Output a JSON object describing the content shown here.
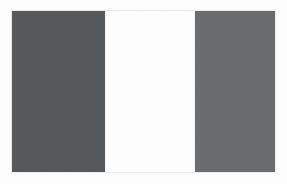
{
  "viewer": {
    "name": "flag-image",
    "background_color": "#fdfdfd",
    "frame_border_color": "#e9e9e9",
    "image_width": 287,
    "image_height": 184
  },
  "flag": {
    "orientation": "vertical-tricolour",
    "band_count": 3,
    "plate": {
      "x": 11,
      "y": 10,
      "width": 265,
      "height": 163
    },
    "bands": [
      {
        "position": "hoist",
        "label": "",
        "color": "#57585a",
        "width_px": 93
      },
      {
        "position": "middle",
        "label": "",
        "color": "#ffffff",
        "width_px": 90
      },
      {
        "position": "fly",
        "label": "",
        "color": "#6b6c6e",
        "width_px": 82
      }
    ]
  }
}
